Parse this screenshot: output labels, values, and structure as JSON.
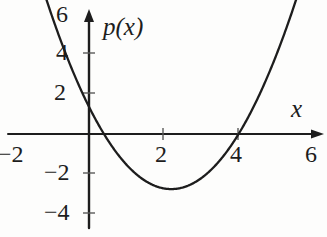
{
  "figure": {
    "kind": "cartesian-plot",
    "background_color": "#fdfdfc",
    "ink_color": "#1d1d1d"
  },
  "labels": {
    "function_label": "p(x)",
    "x_axis_label": "x"
  },
  "axes": {
    "x": {
      "label": "x",
      "ticks": [
        -2,
        2,
        4,
        6
      ],
      "tick_labels": [
        "−2",
        "2",
        "4",
        "6"
      ],
      "range": [
        -2.2,
        6.4
      ],
      "arrow": "right"
    },
    "y": {
      "label": "p(x)",
      "ticks": [
        -4,
        -2,
        2,
        4,
        6
      ],
      "tick_labels": [
        "−4",
        "−2",
        "2",
        "4",
        "6"
      ],
      "range": [
        -5.2,
        6.4
      ],
      "arrow": "up"
    },
    "grid": false
  },
  "chart_data": {
    "type": "line",
    "title": "",
    "subtitle": "",
    "xlabel": "x",
    "ylabel": "p(x)",
    "xlim": [
      -2.2,
      6.4
    ],
    "ylim": [
      -5.2,
      6.4
    ],
    "grid": false,
    "legend": "none",
    "x_ticks": [
      -2,
      2,
      4,
      6
    ],
    "y_ticks": [
      -4,
      -2,
      2,
      4,
      6
    ],
    "annotations": [],
    "series": [
      {
        "name": "p(x)",
        "shape": "parabola",
        "color": "#1d1d1d",
        "roots": [
          0.4,
          4.0
        ],
        "vertex": [
          2.2,
          -3.05
        ],
        "y_intercept": 1.4,
        "leading_coefficient": 0.85,
        "equation": "p(x) = 0.85(x - 0.4)(x - 4)",
        "x": [
          -0.9,
          -0.5,
          0.0,
          0.4,
          1.0,
          1.5,
          2.0,
          2.2,
          2.5,
          3.0,
          3.5,
          4.0,
          4.5,
          5.0,
          5.4
        ],
        "values": [
          6.6,
          4.0,
          1.4,
          0.0,
          -2.0,
          -2.8,
          -3.0,
          -3.05,
          -2.8,
          -2.2,
          -1.1,
          0.0,
          1.6,
          3.5,
          5.2
        ]
      }
    ]
  }
}
